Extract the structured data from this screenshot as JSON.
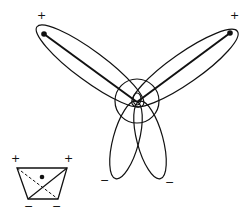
{
  "diagram": {
    "type": "orbital-lobes",
    "stroke_color": "#111111",
    "background": "#ffffff",
    "main": {
      "labels": {
        "top_left_sign": "+",
        "top_right_sign": "+",
        "bottom_left_sign": "−",
        "bottom_right_sign": "−"
      },
      "center_circle": {
        "cx": 137,
        "cy": 101,
        "r": 22
      },
      "lobes": [
        {
          "name": "upper-left",
          "sign": "+"
        },
        {
          "name": "upper-right",
          "sign": "+"
        },
        {
          "name": "lower-left",
          "sign": "−"
        },
        {
          "name": "lower-right",
          "sign": "−"
        }
      ]
    },
    "inset": {
      "shape": "trapezoid",
      "labels": {
        "top_left_sign": "+",
        "top_right_sign": "+",
        "bottom_left_sign": "−",
        "bottom_right_sign": "−"
      }
    }
  }
}
